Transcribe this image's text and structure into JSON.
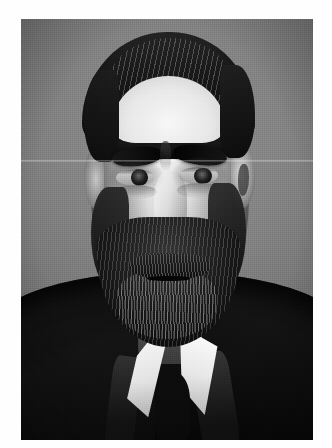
{
  "page": {
    "background_color": "#ffffff",
    "width": 332,
    "height": 448
  },
  "photograph": {
    "name": "portrait-photograph",
    "alt_text": "Black and white portrait photograph of a bearded man",
    "medium": "black-and-white photograph",
    "orientation": "portrait",
    "frame": {
      "left": 21,
      "top": 19,
      "width": 292,
      "height": 421
    },
    "palette": {
      "backdrop_grey": "#7e7e7e",
      "highlight": "#efefef",
      "midtone": "#9e9e9e",
      "shadow": "#1a1a1a",
      "black": "#0d0d0d",
      "paper_white": "#ffffff"
    },
    "subject": {
      "description": "Middle-aged man, head and shoulders, facing the viewer",
      "features": [
        "dark hair swept back from a high forehead",
        "heavy dark eyebrows",
        "deep-set eyes with a direct gaze",
        "prominent nose",
        "thick moustache",
        "full beard with grey streaks",
        "white winged collar",
        "dark suit jacket"
      ]
    },
    "condition": {
      "crease": "faint horizontal fold line across the upper third",
      "grain": "visible halftone film grain",
      "vignette": "slight darkening toward the corners"
    }
  }
}
